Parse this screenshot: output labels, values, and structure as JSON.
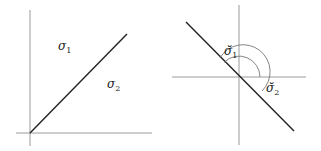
{
  "diagrams": [
    {
      "name": "left-diagram",
      "labels": [
        {
          "base": "σ",
          "sub": "1",
          "x": 58,
          "y": 50
        },
        {
          "base": "σ",
          "sub": "2",
          "x": 107,
          "y": 88
        }
      ]
    },
    {
      "name": "right-diagram",
      "labels": [
        {
          "base": "σ̆",
          "sub": "1",
          "x": 224,
          "y": 55
        },
        {
          "base": "σ̆",
          "sub": "2",
          "x": 266,
          "y": 92
        }
      ]
    }
  ],
  "colors": {
    "axis": "#9a9a9a",
    "line": "#222222",
    "arc": "#777777"
  }
}
